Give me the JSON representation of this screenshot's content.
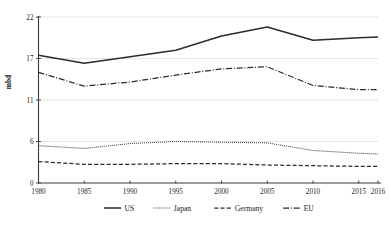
{
  "chart_data": {
    "type": "line",
    "title": "",
    "subtitle": "",
    "xlabel": "",
    "ylabel": "mbd",
    "x": [
      "1980",
      "1985",
      "1990",
      "1995",
      "2000",
      "2005",
      "2010",
      "2015",
      "2016"
    ],
    "x_tick_labels": [
      "1980",
      "1985",
      "1990",
      "1995",
      "2000",
      "2005",
      "2010",
      "2015",
      "2016"
    ],
    "y_tick_labels": [
      "0",
      "6",
      "11",
      "17",
      "22"
    ],
    "y_tick_values": [
      0,
      6,
      11,
      17,
      22
    ],
    "ylim": [
      0,
      22
    ],
    "grid": "horizontal",
    "legend_position": "bottom",
    "series": [
      {
        "name": "US",
        "style": "solid",
        "values": [
          17.4,
          16.3,
          17.2,
          18.0,
          19.7,
          20.8,
          19.2,
          19.5,
          19.6
        ]
      },
      {
        "name": "Japan",
        "style": "dotted",
        "values": [
          5.4,
          5.0,
          5.7,
          6.0,
          5.9,
          5.8,
          4.7,
          4.3,
          4.2
        ]
      },
      {
        "name": "Germany",
        "style": "dashed",
        "values": [
          3.1,
          2.7,
          2.7,
          2.8,
          2.8,
          2.6,
          2.5,
          2.4,
          2.4
        ]
      },
      {
        "name": "EU",
        "style": "dash-dot",
        "values": [
          15.0,
          13.0,
          13.6,
          14.6,
          15.5,
          15.8,
          13.1,
          12.5,
          12.5
        ]
      }
    ]
  },
  "legend": {
    "items": [
      {
        "label": "US",
        "style": "solid"
      },
      {
        "label": "Japan",
        "style": "dotted"
      },
      {
        "label": "Germany",
        "style": "dashed"
      },
      {
        "label": "EU",
        "style": "dash-dot"
      }
    ]
  },
  "axes": {
    "y_axis_title": "mbd"
  },
  "colors": {
    "line": "#2b2b2b",
    "grid": "#d9d9d9",
    "axis": "#3a3a3a",
    "text": "#1a1a1a",
    "background": "#ffffff"
  }
}
